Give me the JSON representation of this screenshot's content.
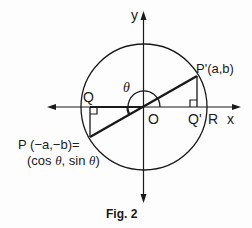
{
  "figure": {
    "caption": "Fig. 2",
    "axes": {
      "x_label": "x",
      "y_label": "y"
    },
    "points": {
      "origin": "O",
      "Q": "Q",
      "Q_prime": "Q'",
      "R": "R",
      "P_prime": "P'(a,b)",
      "P_line1": "P (−a,−b)=",
      "P_line2_prefix": "(cos ",
      "P_line2_theta1": "θ",
      "P_line2_mid": ", sin ",
      "P_line2_theta2": "θ",
      "P_line2_suffix": ")"
    },
    "angle_label": "θ",
    "geometry": {
      "center": [
        144,
        107
      ],
      "radius": 63,
      "P": [
        90,
        137
      ],
      "P_prime": [
        197,
        76
      ]
    },
    "colors": {
      "ink": "#1a1a1a",
      "background": "#fdfdfd"
    }
  }
}
